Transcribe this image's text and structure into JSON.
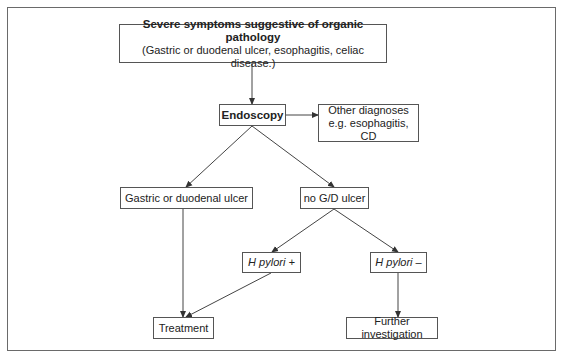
{
  "diagram": {
    "type": "flowchart",
    "nodes": {
      "start": {
        "title": "Severe symptoms suggestive of organic pathology",
        "subtitle": "(Gastric or duodenal ulcer, esophagitis, celiac disease.)"
      },
      "endoscopy": {
        "label": "Endoscopy"
      },
      "other": {
        "line1": "Other diagnoses",
        "line2": "e.g. esophagitis, CD"
      },
      "ulcer": {
        "label": "Gastric or duodenal ulcer"
      },
      "no_ulcer": {
        "label": "no G/D ulcer"
      },
      "hp_pos": {
        "label": "H pylori +"
      },
      "hp_neg": {
        "label": "H pylori –"
      },
      "treatment": {
        "label": "Treatment"
      },
      "further": {
        "label": "Further investigation"
      }
    },
    "edges": [
      {
        "from": "start",
        "to": "endoscopy"
      },
      {
        "from": "endoscopy",
        "to": "other"
      },
      {
        "from": "endoscopy",
        "to": "ulcer"
      },
      {
        "from": "endoscopy",
        "to": "no_ulcer"
      },
      {
        "from": "no_ulcer",
        "to": "hp_pos"
      },
      {
        "from": "no_ulcer",
        "to": "hp_neg"
      },
      {
        "from": "ulcer",
        "to": "treatment"
      },
      {
        "from": "hp_pos",
        "to": "treatment"
      },
      {
        "from": "hp_neg",
        "to": "further"
      }
    ]
  }
}
